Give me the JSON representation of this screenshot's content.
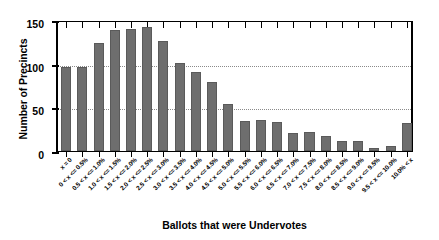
{
  "chart_data": {
    "type": "bar",
    "title": "",
    "xlabel": "Ballots that were Undervotes",
    "ylabel": "Number of Precincts",
    "ylim": [
      0,
      150
    ],
    "yticks": [
      0,
      50,
      100,
      150
    ],
    "grid": true,
    "legend": false,
    "categories": [
      "x = 0",
      "0 < x <= 0.5%",
      "0.5 < x <= 1.0%",
      "1.0 < x <= 1.5%",
      "1.5 < x <= 2.0%",
      "2.0 < x <= 2.5%",
      "2.5 < x <= 3.0%",
      "3.0 < x <= 3.5%",
      "3.5 < x <= 4.0%",
      "4.0 < x <= 4.5%",
      "4.5 < x <= 5.0%",
      "5.0 < x <= 5.5%",
      "5.5 < x <= 6.0%",
      "6.0 < x <= 6.5%",
      "6.5 < x <= 7.0%",
      "7.0 < x <= 7.5%",
      "7.5 < x <= 8.0%",
      "8.0 < x <= 8.5%",
      "8.5 < x <= 9.0%",
      "9.0 < x <= 9.5%",
      "9.5 < x <= 10.0%",
      "10.0% < x"
    ],
    "values": [
      96,
      96,
      124,
      138,
      140,
      142,
      126,
      101,
      90,
      79,
      54,
      34,
      35,
      33,
      21,
      22,
      17,
      12,
      11,
      4,
      6,
      32
    ],
    "bar_color": "#6e6e6e",
    "axis_color": "#000000",
    "grid_color": "#8a8a8a",
    "background": "#ffffff"
  }
}
